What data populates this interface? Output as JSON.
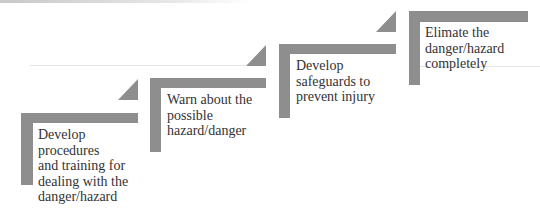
{
  "diagram": {
    "type": "staircase",
    "bar_color": "#8e8e8e",
    "text_color": "#333333",
    "header_fragment": "",
    "steps": [
      {
        "order": 1,
        "lines": [
          "Develop",
          "procedures",
          "and training for",
          "dealing with the",
          "danger/hazard"
        ]
      },
      {
        "order": 2,
        "lines": [
          "Warn about the",
          "possible",
          "hazard/danger"
        ]
      },
      {
        "order": 3,
        "lines": [
          "Develop",
          "safeguards to",
          "prevent injury"
        ]
      },
      {
        "order": 4,
        "lines": [
          "Elimate the",
          "danger/hazard",
          "completely"
        ]
      }
    ]
  }
}
